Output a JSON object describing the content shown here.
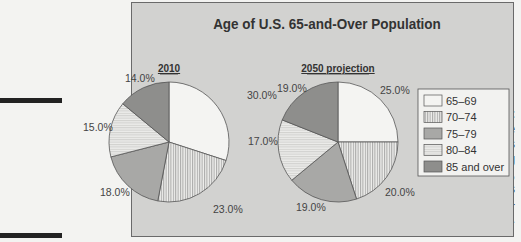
{
  "caption": {
    "figure_label": "Figure 6-4:",
    "lines": [
      "Side-by-side",
      "pie charts",
      "on the aging",
      "population,",
      "2010 versus",
      "2050 projec-",
      "tions."
    ]
  },
  "chart_data": [
    {
      "type": "pie",
      "title": "Age of U.S. 65-and-Over Population",
      "subtitle": "2010",
      "categories": [
        "65–69",
        "70–74",
        "75–79",
        "80–84",
        "85 and over"
      ],
      "values": [
        30.0,
        23.0,
        18.0,
        15.0,
        14.0
      ],
      "labels": [
        "30.0%",
        "23.0%",
        "18.0%",
        "15.0%",
        "14.0%"
      ],
      "start_angle": "12 o'clock, clockwise"
    },
    {
      "type": "pie",
      "title": "Age of U.S. 65-and-Over Population",
      "subtitle": "2050 projection",
      "categories": [
        "65–69",
        "70–74",
        "75–79",
        "80–84",
        "85 and over"
      ],
      "values": [
        25.0,
        20.0,
        19.0,
        17.0,
        19.0
      ],
      "labels": [
        "25.0%",
        "20.0%",
        "19.0%",
        "17.0%",
        "19.0%"
      ],
      "start_angle": "12 o'clock, clockwise"
    }
  ],
  "chart": {
    "title": "Age of U.S. 65-and-Over Population",
    "pie1_title": "2010",
    "pie2_title": "2050 projection",
    "legend": [
      {
        "label": "65–69",
        "fill": "#f4f4f2",
        "pattern": "none"
      },
      {
        "label": "70–74",
        "fill": "#ececec",
        "pattern": "vertical-lines"
      },
      {
        "label": "75–79",
        "fill": "#a8a8a6",
        "pattern": "none"
      },
      {
        "label": "80–84",
        "fill": "#e6e6e4",
        "pattern": "horizontal-lines"
      },
      {
        "label": "85 and over",
        "fill": "#8e8e8c",
        "pattern": "none"
      }
    ],
    "pie1_labels": [
      "30.0%",
      "23.0%",
      "18.0%",
      "15.0%",
      "14.0%"
    ],
    "pie2_labels": [
      "25.0%",
      "20.0%",
      "19.0%",
      "17.0%",
      "19.0%"
    ]
  }
}
